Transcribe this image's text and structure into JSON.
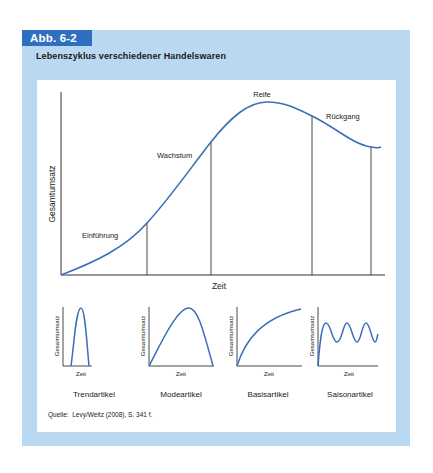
{
  "figure": {
    "tab_label": "Abb. 6-2",
    "title": "Lebenszyklus verschiedener Handelswaren",
    "source": "Quelle:  Levy/Weitz (2008), S. 341 f.",
    "colors": {
      "frame": "#b9d9f3",
      "tab": "#2f6fc0",
      "curve": "#3a6fb8",
      "axis": "#333333"
    }
  },
  "main_chart": {
    "xlabel": "Zeit",
    "ylabel": "Gesamtumsatz",
    "phases": [
      "Einführung",
      "Wachstum",
      "Reife",
      "Rückgang"
    ]
  },
  "small_charts": [
    {
      "name": "Trendartikel",
      "xlabel": "Zeit",
      "ylabel": "Gesamtumsatz"
    },
    {
      "name": "Modeartikel",
      "xlabel": "Zeit",
      "ylabel": "Gesamtumsatz"
    },
    {
      "name": "Basisartikel",
      "xlabel": "Zeit",
      "ylabel": "Gesamtumsatz"
    },
    {
      "name": "Saisonartikel",
      "xlabel": "Zeit",
      "ylabel": "Gesamtumsatz"
    }
  ]
}
